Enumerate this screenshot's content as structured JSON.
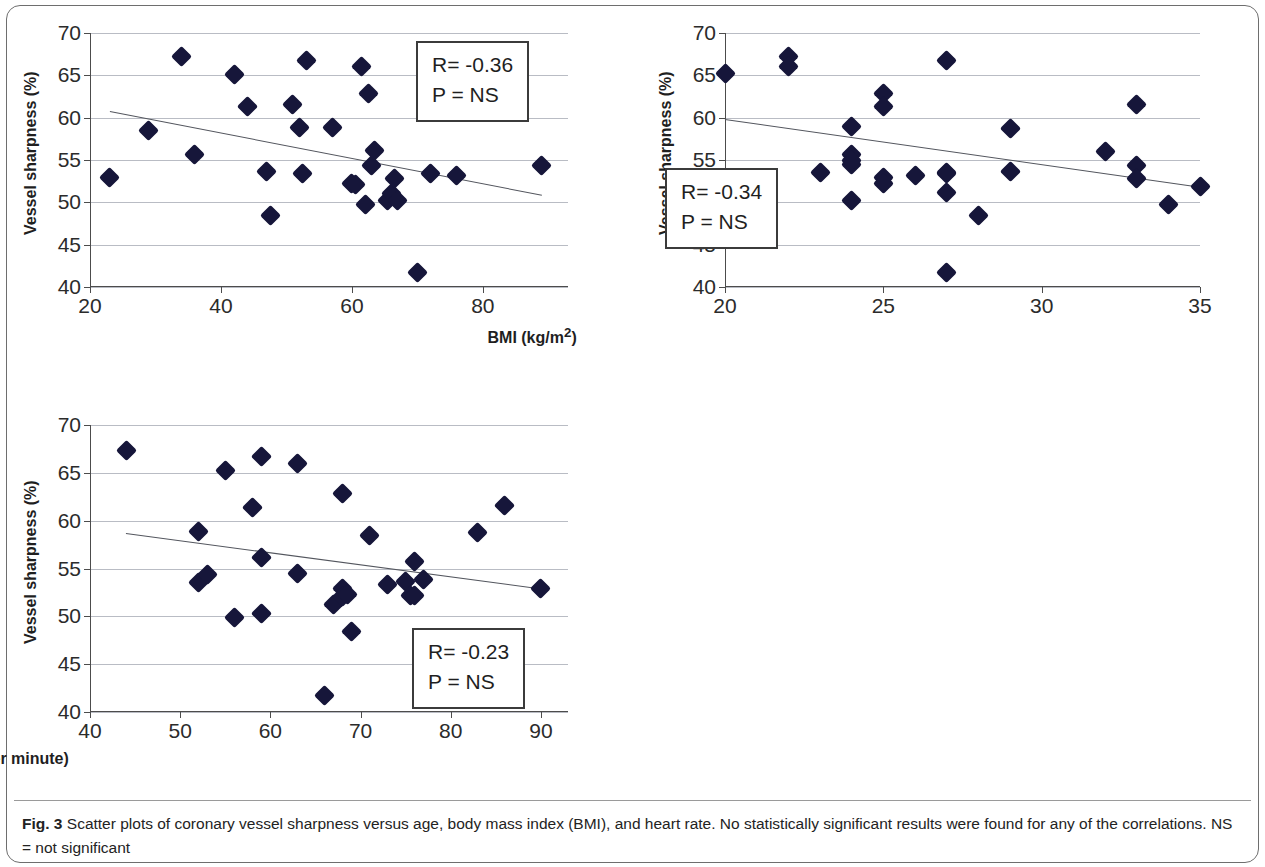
{
  "figure": {
    "label": "Fig. 3",
    "caption": "Scatter plots of coronary vessel sharpness versus age, body mass index (BMI), and heart rate. No statistically significant results were found for any of the correlations. NS = not significant",
    "marker_color": "#16163a",
    "gridline_color": "#b9bcc4",
    "axis_color": "#4c4c4c",
    "trendline_color": "#53565e"
  },
  "chart_data": [
    {
      "type": "scatter",
      "id": "age",
      "title": "",
      "xlabel": "Age (years)",
      "ylabel": "Vessel sharpness (%)",
      "xlim": [
        20,
        93
      ],
      "ylim": [
        40,
        70
      ],
      "xticks": [
        20,
        40,
        60,
        80
      ],
      "yticks": [
        40,
        45,
        50,
        55,
        60,
        65,
        70
      ],
      "grid": true,
      "legend": "none",
      "annotation": {
        "r_label": "R= -0.36",
        "p_label": "P = NS",
        "r_value": -0.36,
        "p_value": "NS"
      },
      "trendline": {
        "x0": 23,
        "y0": 60.8,
        "x1": 89,
        "y1": 50.9
      },
      "x": [
        23,
        29,
        34,
        36,
        42,
        44,
        47,
        47.5,
        51,
        52,
        52.5,
        53,
        57,
        60,
        60.5,
        61.5,
        62,
        62.5,
        63,
        63.5,
        65.5,
        66,
        66.5,
        67,
        70,
        72,
        76,
        89
      ],
      "y": [
        52.9,
        58.5,
        67.2,
        55.7,
        65.1,
        61.3,
        53.7,
        48.4,
        61.6,
        58.8,
        53.4,
        66.7,
        58.8,
        52.2,
        52.1,
        66.0,
        49.8,
        62.8,
        54.4,
        56.1,
        50.2,
        51.1,
        52.8,
        50.2,
        41.7,
        53.4,
        53.2,
        54.4
      ]
    },
    {
      "type": "scatter",
      "id": "bmi",
      "title": "",
      "xlabel": "BMI (kg/m2)",
      "xlabel_html": "BMI (kg/m<sup>2</sup>)",
      "ylabel": "Vessel sharpness (%)",
      "xlim": [
        20,
        35
      ],
      "ylim": [
        40,
        70
      ],
      "xticks": [
        20,
        25,
        30,
        35
      ],
      "yticks": [
        40,
        45,
        50,
        55,
        60,
        65,
        70
      ],
      "grid": true,
      "legend": "none",
      "annotation": {
        "r_label": "R= -0.34",
        "p_label": "P = NS",
        "r_value": -0.34,
        "p_value": "NS"
      },
      "trendline": {
        "x0": 20,
        "y0": 59.9,
        "x1": 35,
        "y1": 51.9
      },
      "x": [
        20,
        22,
        22,
        23,
        24,
        24,
        24,
        24,
        24,
        25,
        25,
        25,
        25,
        26,
        27,
        27,
        27,
        27,
        27,
        28,
        29,
        29,
        32,
        33,
        33,
        33,
        34,
        35
      ],
      "y": [
        65.2,
        67.2,
        66.0,
        53.5,
        58.9,
        55.7,
        54.5,
        50.2,
        54.9,
        62.8,
        61.3,
        52.9,
        52.2,
        53.2,
        66.7,
        53.5,
        51.2,
        41.7,
        53.4,
        48.4,
        58.7,
        53.7,
        56.0,
        61.6,
        54.4,
        52.8,
        49.7,
        51.9
      ]
    },
    {
      "type": "scatter",
      "id": "heart-rate",
      "title": "",
      "xlabel": "Heart rate (beats per minute)",
      "ylabel": "Vessel sharpness (%)",
      "xlim": [
        40,
        93
      ],
      "ylim": [
        40,
        70
      ],
      "xticks": [
        40,
        50,
        60,
        70,
        80,
        90
      ],
      "yticks": [
        40,
        45,
        50,
        55,
        60,
        65,
        70
      ],
      "grid": true,
      "legend": "none",
      "annotation": {
        "r_label": "R= -0.23",
        "p_label": "P = NS",
        "r_value": -0.23,
        "p_value": "NS"
      },
      "trendline": {
        "x0": 44,
        "y0": 58.7,
        "x1": 90,
        "y1": 52.9
      },
      "x": [
        44,
        52,
        52,
        53,
        55,
        56,
        58,
        59,
        59,
        59,
        63,
        63,
        66,
        67,
        68,
        68,
        68,
        68.5,
        69,
        71,
        73,
        75,
        75.5,
        76,
        76,
        77,
        83,
        86,
        90
      ],
      "y": [
        67.3,
        58.9,
        53.5,
        54.4,
        65.2,
        49.9,
        61.4,
        66.7,
        56.1,
        50.3,
        66.0,
        54.5,
        41.7,
        51.2,
        62.8,
        52.9,
        52.1,
        52.3,
        48.4,
        58.5,
        53.3,
        53.6,
        52.2,
        55.7,
        52.2,
        53.8,
        58.8,
        61.6,
        52.9
      ]
    }
  ]
}
